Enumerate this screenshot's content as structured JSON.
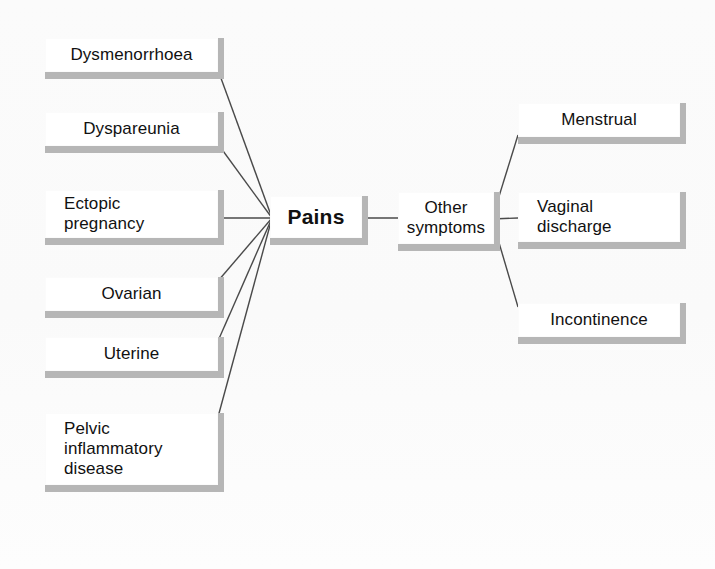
{
  "diagram": {
    "background_color": "#fdfdfd",
    "node_fill_color": "#ffffff",
    "node_shadow_color": "#b6b6b6",
    "edge_color": "#4a4a4a",
    "text_color": "#111111"
  },
  "hubs": {
    "pains": {
      "label": "Pains",
      "x": 270,
      "y": 196,
      "w": 92,
      "h": 42,
      "align": "center",
      "bold": true
    },
    "other_symptoms": {
      "label": "Other\nsymptoms",
      "x": 398,
      "y": 192,
      "w": 96,
      "h": 52,
      "align": "center",
      "bold": false
    }
  },
  "pain_nodes": [
    {
      "label": "Dysmenorrhoea",
      "x": 45,
      "y": 38,
      "w": 173,
      "h": 34,
      "align": "center",
      "anchor_x": 218,
      "anchor_y": 70
    },
    {
      "label": "Dyspareunia",
      "x": 45,
      "y": 112,
      "w": 173,
      "h": 34,
      "align": "center",
      "anchor_x": 218,
      "anchor_y": 144
    },
    {
      "label": "Ectopic\npregnancy",
      "x": 45,
      "y": 190,
      "w": 173,
      "h": 48,
      "align": "left",
      "anchor_x": 218,
      "anchor_y": 218
    },
    {
      "label": "Ovarian",
      "x": 45,
      "y": 277,
      "w": 173,
      "h": 34,
      "align": "center",
      "anchor_x": 218,
      "anchor_y": 281
    },
    {
      "label": "Uterine",
      "x": 45,
      "y": 337,
      "w": 173,
      "h": 34,
      "align": "center",
      "anchor_x": 218,
      "anchor_y": 341
    },
    {
      "label": "Pelvic\ninflammatory\ndisease",
      "x": 45,
      "y": 413,
      "w": 173,
      "h": 72,
      "align": "left",
      "anchor_x": 218,
      "anchor_y": 417
    }
  ],
  "other_nodes": [
    {
      "label": "Menstrual",
      "x": 518,
      "y": 103,
      "w": 162,
      "h": 34,
      "align": "center",
      "anchor_x": 518,
      "anchor_y": 135
    },
    {
      "label": "Vaginal\ndischarge",
      "x": 518,
      "y": 192,
      "w": 162,
      "h": 50,
      "align": "left",
      "anchor_x": 518,
      "anchor_y": 218
    },
    {
      "label": "Incontinence",
      "x": 518,
      "y": 303,
      "w": 162,
      "h": 34,
      "align": "center",
      "anchor_x": 518,
      "anchor_y": 307
    }
  ],
  "edges": {
    "pains_hub_point": {
      "x": 272,
      "y": 218
    },
    "other_hub_point": {
      "x": 492,
      "y": 219
    },
    "other_to_pains_link": {
      "from_x": 362,
      "from_y": 218,
      "to_x": 398,
      "to_y": 218
    }
  }
}
